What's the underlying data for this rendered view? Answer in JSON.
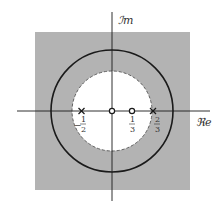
{
  "diagram": {
    "type": "pole-zero plot (z-plane) with region of convergence",
    "axes": {
      "real_label": "ℜe",
      "imag_label": "ℐm"
    },
    "colors": {
      "roc_fill": "#b3b3b3",
      "background": "#ffffff",
      "stroke": "#1a1a1a",
      "dashed_circle": "#555555"
    },
    "unit_circle": {
      "radius": 1,
      "style": "solid"
    },
    "inner_circle": {
      "radius": "2/3",
      "style": "dashed"
    },
    "poles": [
      {
        "value": "-1/2",
        "num": "1",
        "den": "2",
        "sign": "−",
        "marker": "x"
      },
      {
        "value": "2/3",
        "num": "2",
        "den": "3",
        "sign": "",
        "marker": "x"
      }
    ],
    "zeros": [
      {
        "value": "0",
        "marker": "o"
      },
      {
        "value": "1/3",
        "num": "1",
        "den": "3",
        "marker": "o"
      }
    ],
    "roc": "|z| > 2/3 (shaded region outside dashed circle)"
  }
}
